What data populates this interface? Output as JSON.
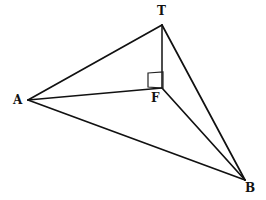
{
  "figure": {
    "background_color": "#ffffff",
    "line_color": "#111111",
    "width": 266,
    "height": 200,
    "vertices": [
      {
        "id": "T",
        "label": "T",
        "x": 162,
        "y": 25,
        "label_x": 157,
        "label_y": 5
      },
      {
        "id": "A",
        "label": "A",
        "x": 28,
        "y": 100,
        "label_x": 13,
        "label_y": 94
      },
      {
        "id": "F",
        "label": "F",
        "x": 162,
        "y": 88,
        "label_x": 151,
        "label_y": 92
      },
      {
        "id": "B",
        "label": "B",
        "x": 245,
        "y": 180,
        "label_x": 245,
        "label_y": 182
      }
    ],
    "edges": [
      {
        "id": "T-A",
        "from": "T",
        "to": "A"
      },
      {
        "id": "T-B",
        "from": "T",
        "to": "B"
      },
      {
        "id": "T-F",
        "from": "T",
        "to": "F"
      },
      {
        "id": "A-F",
        "from": "A",
        "to": "F"
      },
      {
        "id": "A-B",
        "from": "A",
        "to": "B"
      },
      {
        "id": "F-B",
        "from": "F",
        "to": "B"
      }
    ],
    "angle_marker": {
      "id": "right-angle-at-F",
      "type": "square",
      "at_vertex": "F",
      "points": "148,73 163,72 163,88 148,87"
    }
  }
}
